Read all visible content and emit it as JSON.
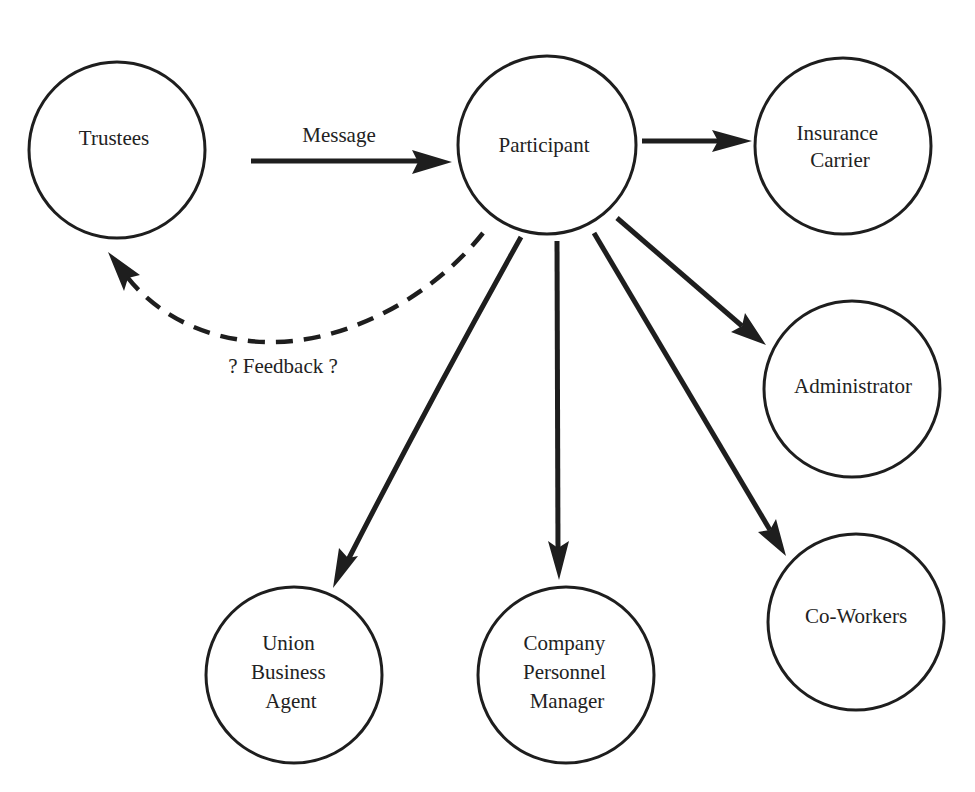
{
  "diagram": {
    "nodes": [
      {
        "id": "trustees",
        "lines": [
          "Trustees"
        ],
        "label_position": "upper"
      },
      {
        "id": "participant",
        "lines": [
          "Participant"
        ],
        "label_position": "center"
      },
      {
        "id": "insurance-carrier",
        "lines": [
          "Insurance",
          "Carrier"
        ],
        "label_position": "center"
      },
      {
        "id": "administrator",
        "lines": [
          "Administrator"
        ],
        "label_position": "center"
      },
      {
        "id": "co-workers",
        "lines": [
          "Co-Workers"
        ],
        "label_position": "center"
      },
      {
        "id": "union-business-agent",
        "lines": [
          "Union",
          "Business",
          "Agent"
        ],
        "label_position": "center"
      },
      {
        "id": "company-personnel-manager",
        "lines": [
          "Company",
          "Personnel",
          "Manager"
        ],
        "label_position": "center"
      }
    ],
    "edges": [
      {
        "id": "message",
        "from": "trustees",
        "to": "participant",
        "style": "solid",
        "label": "Message"
      },
      {
        "id": "to-insurance",
        "from": "participant",
        "to": "insurance-carrier",
        "style": "solid",
        "label": ""
      },
      {
        "id": "to-administrator",
        "from": "participant",
        "to": "administrator",
        "style": "solid",
        "label": ""
      },
      {
        "id": "to-co-workers",
        "from": "participant",
        "to": "co-workers",
        "style": "solid",
        "label": ""
      },
      {
        "id": "to-company",
        "from": "participant",
        "to": "company-personnel-manager",
        "style": "solid",
        "label": ""
      },
      {
        "id": "to-union",
        "from": "participant",
        "to": "union-business-agent",
        "style": "solid",
        "label": ""
      },
      {
        "id": "feedback",
        "from": "participant",
        "to": "trustees",
        "style": "dashed",
        "label": "? Feedback ?"
      }
    ]
  }
}
